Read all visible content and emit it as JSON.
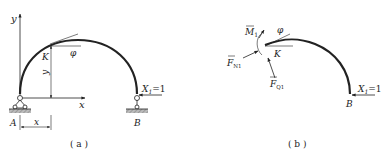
{
  "panel_a": {
    "caption": "( a )",
    "axis_y_label": "y",
    "axis_x_label": "x",
    "point_k_label": "K",
    "angle_label": "φ",
    "height_label": "y",
    "dim_x_label": "x",
    "support_a_label": "A",
    "support_b_label": "B",
    "load_label_base": "X",
    "load_label_sub": "1",
    "load_label_value": "=1"
  },
  "panel_b": {
    "caption": "( b )",
    "moment_label": "M",
    "moment_sub": "1",
    "normal_force_label": "F",
    "normal_force_sub": "N1",
    "shear_force_label": "F",
    "shear_force_sub": "Q1",
    "angle_label": "φ",
    "point_k_label": "K",
    "support_b_label": "B",
    "load_label_base": "X",
    "load_label_sub": "1",
    "load_label_value": "=1"
  },
  "colors": {
    "ink": "#222222",
    "hatch": "#888888"
  }
}
